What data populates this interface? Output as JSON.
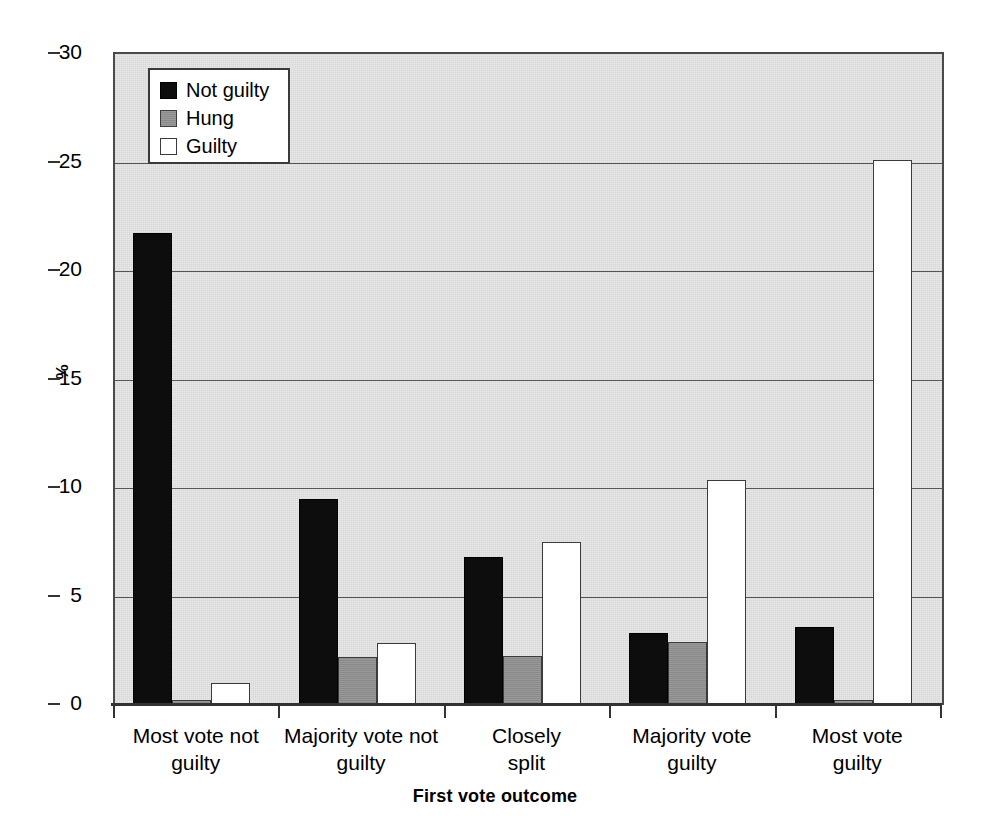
{
  "chart_data": {
    "type": "bar",
    "title": "",
    "xlabel": "First vote outcome",
    "ylabel": "%",
    "ylim": [
      0,
      30
    ],
    "ytick_labels": [
      "0",
      "5",
      "10",
      "15",
      "20",
      "25",
      "30"
    ],
    "yticks": [
      0,
      5,
      10,
      15,
      20,
      25,
      30
    ],
    "grid": true,
    "legend_position": "top-left-inside",
    "categories": [
      "Most vote not\nguilty",
      "Majority vote not\nguilty",
      "Closely\nsplit",
      "Majority vote\nguilty",
      "Most vote\nguilty"
    ],
    "series": [
      {
        "name": "Not guilty",
        "color": "#0d0d0d",
        "values": [
          21.75,
          9.5,
          6.8,
          3.3,
          3.6
        ]
      },
      {
        "name": "Hung",
        "color": "#8a8a8a",
        "values": [
          0.25,
          2.2,
          2.25,
          2.9,
          0.25
        ]
      },
      {
        "name": "Guilty",
        "color": "#ffffff",
        "values": [
          1.0,
          2.85,
          7.5,
          10.35,
          25.1
        ]
      }
    ]
  },
  "legend": {
    "items": [
      {
        "label": "Not guilty"
      },
      {
        "label": "Hung"
      },
      {
        "label": "Guilty"
      }
    ]
  },
  "axes": {
    "y_title": "%",
    "x_title": "First vote outcome"
  },
  "colors": {
    "plot_background": "#e8e8e8",
    "axis": "#333333",
    "gridline": "#55565a",
    "not_guilty": "#0d0d0d",
    "hung": "#8a8a8a",
    "guilty": "#ffffff"
  }
}
